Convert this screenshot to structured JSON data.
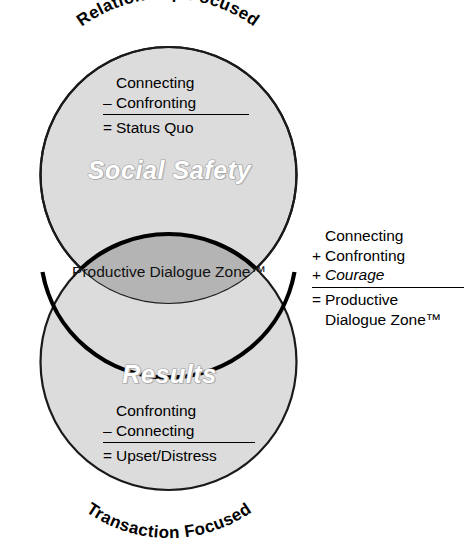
{
  "diagram": {
    "type": "venn-two-circle-vertical",
    "title_text_visible": false,
    "colors": {
      "circle_fill": "#dcdcdc",
      "circle_stroke": "#1a1a1a",
      "lens_fill": "#b4b4b4",
      "lens_stroke": "#000000",
      "page_background": "#ffffff",
      "text": "#000000",
      "emboss_outline": "#9a9a9a"
    },
    "arc_labels": {
      "top": "Relationship Focused",
      "bottom": "Transaction Focused"
    },
    "circles": [
      {
        "name": "upper-circle",
        "zone_label": "Social Safety"
      },
      {
        "name": "lower-circle",
        "zone_label": "Results"
      }
    ],
    "intersection": {
      "name": "productive-dialogue-zone",
      "label": "Productive Dialogue Zone™"
    }
  },
  "equations": {
    "social_safety": {
      "name": "social-safety-equation",
      "rows": [
        {
          "op": "",
          "term": "Connecting",
          "italic": false
        },
        {
          "op": "–",
          "term": "Confronting",
          "italic": false
        }
      ],
      "result_op": "=",
      "result": "Status Quo"
    },
    "results": {
      "name": "results-equation",
      "rows": [
        {
          "op": "",
          "term": "Confronting",
          "italic": false
        },
        {
          "op": "–",
          "term": "Connecting",
          "italic": false
        }
      ],
      "result_op": "=",
      "result": "Upset/Distress"
    },
    "productive_dialogue": {
      "name": "productive-dialogue-equation",
      "rows": [
        {
          "op": "",
          "term": "Connecting",
          "italic": false
        },
        {
          "op": "+",
          "term": "Confronting",
          "italic": false
        },
        {
          "op": "+",
          "term": "Courage",
          "italic": true
        }
      ],
      "result_op": "=",
      "result_line1": "Productive",
      "result_line2": "Dialogue Zone™"
    }
  }
}
